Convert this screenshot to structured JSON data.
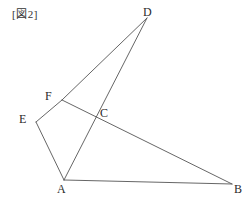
{
  "figure": {
    "caption": "[図2]",
    "background_color": "#ffffff",
    "stroke_color": "#555555",
    "label_color": "#2b2b2b",
    "canvas": {
      "width": 252,
      "height": 202
    },
    "points": [
      {
        "id": "D",
        "label": "D",
        "x": 147,
        "y": 18,
        "label_x": 143,
        "label_y": 6,
        "kind": "vertex"
      },
      {
        "id": "F",
        "label": "F",
        "x": 62,
        "y": 100,
        "label_x": 45,
        "label_y": 90,
        "kind": "vertex"
      },
      {
        "id": "E",
        "label": "E",
        "x": 36,
        "y": 122,
        "label_x": 19,
        "label_y": 113,
        "kind": "vertex"
      },
      {
        "id": "C",
        "label": "C",
        "x": 96,
        "y": 117,
        "label_x": 100,
        "label_y": 107,
        "kind": "intersection"
      },
      {
        "id": "A",
        "label": "A",
        "x": 64,
        "y": 180,
        "label_x": 57,
        "label_y": 183,
        "kind": "vertex"
      },
      {
        "id": "B",
        "label": "B",
        "x": 232,
        "y": 184,
        "label_x": 234,
        "label_y": 183,
        "kind": "vertex"
      }
    ],
    "segments": [
      {
        "id": "DF",
        "from": "D",
        "to": "F",
        "x1": 147,
        "y1": 18,
        "x2": 62,
        "y2": 100
      },
      {
        "id": "DA",
        "from": "D",
        "to": "A",
        "x1": 147,
        "y1": 18,
        "x2": 64,
        "y2": 180
      },
      {
        "id": "FB",
        "from": "F",
        "to": "B",
        "x1": 62,
        "y1": 100,
        "x2": 232,
        "y2": 184
      },
      {
        "id": "EF",
        "from": "E",
        "to": "F",
        "x1": 36,
        "y1": 122,
        "x2": 62,
        "y2": 100
      },
      {
        "id": "EA",
        "from": "E",
        "to": "A",
        "x1": 36,
        "y1": 122,
        "x2": 64,
        "y2": 180
      },
      {
        "id": "AB",
        "from": "A",
        "to": "B",
        "x1": 64,
        "y1": 180,
        "x2": 232,
        "y2": 184
      }
    ]
  }
}
